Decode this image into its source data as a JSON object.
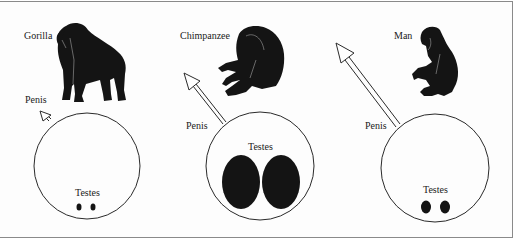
{
  "figure": {
    "panels": [
      {
        "species": "Gorilla",
        "penis_label": "Penis",
        "testes_label": "Testes",
        "relative_body_size": "large",
        "relative_penis_size": "small",
        "relative_testes_size": "small"
      },
      {
        "species": "Chimpanzee",
        "penis_label": "Penis",
        "testes_label": "Testes",
        "relative_body_size": "medium",
        "relative_penis_size": "medium",
        "relative_testes_size": "very large"
      },
      {
        "species": "Man",
        "penis_label": "Penis",
        "testes_label": "Testes",
        "relative_body_size": "medium",
        "relative_penis_size": "large",
        "relative_testes_size": "medium"
      }
    ],
    "colors": {
      "silhouette": "#141414",
      "outline": "#2a2a2a",
      "frame": "#8a8a8a",
      "background": "#fdfdfd"
    }
  }
}
